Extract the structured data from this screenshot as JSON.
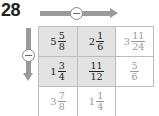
{
  "problem": {
    "number": "28",
    "horizontal_operator": "−",
    "vertical_operator": "−"
  },
  "grid": {
    "rows": [
      [
        {
          "whole": "5",
          "num": "5",
          "den": "8",
          "style": "shaded"
        },
        {
          "whole": "2",
          "num": "1",
          "den": "6",
          "style": "shaded"
        },
        {
          "whole": "3",
          "num": "11",
          "den": "24",
          "style": "faded"
        }
      ],
      [
        {
          "whole": "1",
          "num": "3",
          "den": "4",
          "style": "shaded"
        },
        {
          "whole": "",
          "num": "11",
          "den": "12",
          "style": "shaded"
        },
        {
          "whole": "",
          "num": "5",
          "den": "6",
          "style": "faded"
        }
      ],
      [
        {
          "whole": "3",
          "num": "7",
          "den": "8",
          "style": "faded"
        },
        {
          "whole": "1",
          "num": "1",
          "den": "4",
          "style": "faded"
        },
        {
          "whole": "",
          "num": "",
          "den": "",
          "style": "empty"
        }
      ]
    ]
  },
  "colors": {
    "arrow": "#9a9a9a",
    "shaded_cell": "#e3e3e3",
    "faded_text": "#9a9a9a",
    "grid_line": "#bdbdbd"
  }
}
